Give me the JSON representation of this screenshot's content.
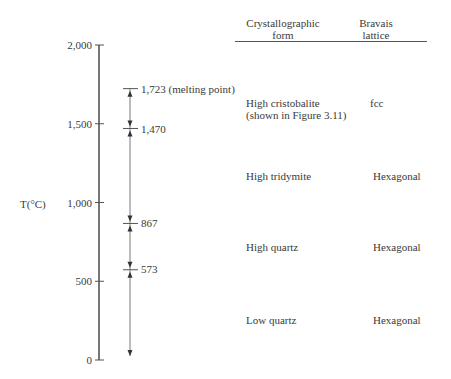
{
  "axis": {
    "label": "T(°C)",
    "min": 0,
    "max": 2000,
    "ticks": [
      {
        "value": 2000,
        "label": "2,000"
      },
      {
        "value": 1500,
        "label": "1,500"
      },
      {
        "value": 1000,
        "label": "1,000"
      },
      {
        "value": 500,
        "label": "500"
      },
      {
        "value": 0,
        "label": "0"
      }
    ]
  },
  "transitions": [
    {
      "value": 1723,
      "label": "1,723 (melting point)"
    },
    {
      "value": 1470,
      "label": "1,470"
    },
    {
      "value": 867,
      "label": "867"
    },
    {
      "value": 573,
      "label": "573"
    }
  ],
  "table": {
    "headers": {
      "form_line1": "Crystallographic",
      "form_line2": "form",
      "lattice_line1": "Bravais",
      "lattice_line2": "lattice"
    },
    "rows": [
      {
        "form_line1": "High cristobalite",
        "form_line2": "(shown in Figure 3.11)",
        "lattice": "fcc",
        "range": [
          1470,
          1723
        ]
      },
      {
        "form_line1": "High tridymite",
        "form_line2": "",
        "lattice": "Hexagonal",
        "range": [
          867,
          1470
        ]
      },
      {
        "form_line1": "High quartz",
        "form_line2": "",
        "lattice": "Hexagonal",
        "range": [
          573,
          867
        ]
      },
      {
        "form_line1": "Low quartz",
        "form_line2": "",
        "lattice": "Hexagonal",
        "range": [
          0,
          573
        ]
      }
    ]
  },
  "colors": {
    "line": "#555555",
    "text": "#3a3a3a"
  }
}
